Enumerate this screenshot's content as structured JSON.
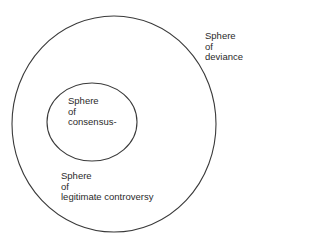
{
  "diagram": {
    "title": "",
    "colors": {
      "stroke": "#3a3a3a",
      "text": "#2a2a2a",
      "background": "#ffffff"
    },
    "shapes": {
      "outer_circle": {
        "cx": 114,
        "cy": 124,
        "rx": 102,
        "ry": 108
      },
      "inner_ellipse": {
        "cx": 92,
        "cy": 122,
        "rx": 45,
        "ry": 39
      }
    },
    "labels": {
      "deviance": {
        "lines": [
          "Sphere",
          "of",
          "deviance"
        ]
      },
      "consensus": {
        "lines": [
          "Sphere",
          "of",
          "consensus-"
        ]
      },
      "controversy": {
        "lines": [
          "Sphere",
          "of",
          "legitimate controversy"
        ]
      }
    }
  }
}
